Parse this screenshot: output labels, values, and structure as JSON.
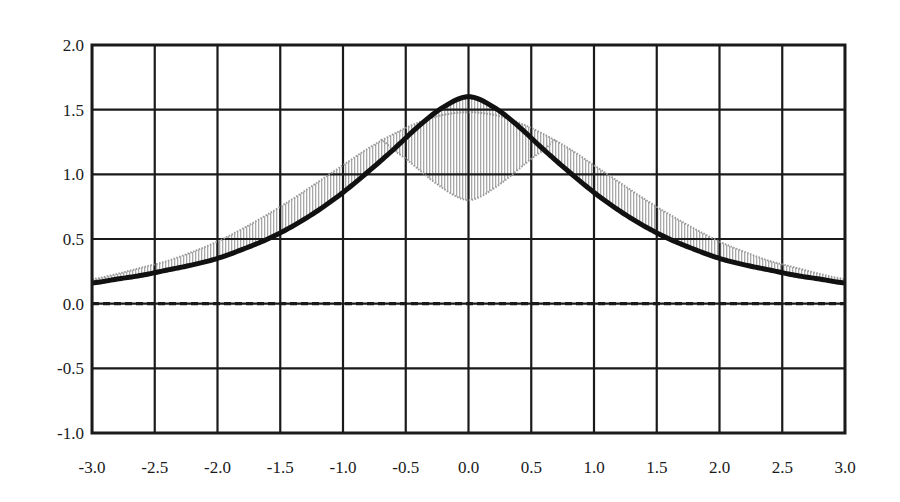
{
  "chart_data": {
    "type": "line",
    "title": "",
    "subtitle": "",
    "xlabel": "",
    "ylabel": "",
    "xlim": [
      -3.0,
      3.0
    ],
    "ylim": [
      -1.0,
      2.0
    ],
    "xticks": [
      -3.0,
      -2.5,
      -2.0,
      -1.5,
      -1.0,
      -0.5,
      0.0,
      0.5,
      1.0,
      1.5,
      2.0,
      2.5,
      3.0
    ],
    "yticks": [
      -1.0,
      -0.5,
      0.0,
      0.5,
      1.0,
      1.5,
      2.0
    ],
    "xtick_labels": [
      "-3.0",
      "-2.5",
      "-2.0",
      "-1.5",
      "-1.0",
      "-0.5",
      "0.0",
      "0.5",
      "1.0",
      "1.5",
      "2.0",
      "2.5",
      "3.0"
    ],
    "ytick_labels": [
      "-1.0",
      "-0.5",
      "0.0",
      "0.5",
      "1.0",
      "1.5",
      "2.0"
    ],
    "grid": true,
    "grid_color": "#1a1a1a",
    "legend": "none",
    "zero_line": {
      "y": 0.0,
      "style": "dashed",
      "color": "#1a1a1a"
    },
    "series": [
      {
        "name": "solid-curve",
        "style": "solid",
        "color": "#111111",
        "line_width": 5,
        "x": [
          -3.0,
          -2.8,
          -2.6,
          -2.4,
          -2.2,
          -2.0,
          -1.8,
          -1.6,
          -1.4,
          -1.2,
          -1.0,
          -0.8,
          -0.6,
          -0.4,
          -0.2,
          0.0,
          0.2,
          0.4,
          0.6,
          0.8,
          1.0,
          1.2,
          1.4,
          1.6,
          1.8,
          2.0,
          2.2,
          2.4,
          2.6,
          2.8,
          3.0
        ],
        "y": [
          0.16,
          0.19,
          0.22,
          0.26,
          0.3,
          0.35,
          0.42,
          0.5,
          0.6,
          0.72,
          0.86,
          1.02,
          1.19,
          1.37,
          1.52,
          1.6,
          1.52,
          1.37,
          1.19,
          1.02,
          0.86,
          0.72,
          0.6,
          0.5,
          0.42,
          0.35,
          0.3,
          0.26,
          0.22,
          0.19,
          0.16
        ]
      },
      {
        "name": "stippled-curve",
        "style": "stippled",
        "color": "#9a9a9a",
        "line_width": 2,
        "x": [
          -3.0,
          -2.8,
          -2.6,
          -2.4,
          -2.2,
          -2.0,
          -1.8,
          -1.6,
          -1.4,
          -1.2,
          -1.0,
          -0.8,
          -0.6,
          -0.4,
          -0.2,
          0.0,
          0.2,
          0.4,
          0.6,
          0.8,
          1.0,
          1.2,
          1.4,
          1.6,
          1.8,
          2.0,
          2.2,
          2.4,
          2.6,
          2.8,
          3.0
        ],
        "y": [
          0.19,
          0.23,
          0.28,
          0.33,
          0.4,
          0.48,
          0.58,
          0.69,
          0.81,
          0.94,
          1.07,
          1.2,
          1.31,
          1.4,
          1.46,
          1.48,
          1.46,
          1.4,
          1.31,
          1.2,
          1.07,
          0.94,
          0.81,
          0.69,
          0.58,
          0.48,
          0.4,
          0.33,
          0.28,
          0.23,
          0.19
        ]
      },
      {
        "name": "stippled-lower-curve",
        "style": "stippled",
        "color": "#9a9a9a",
        "line_width": 2,
        "x": [
          -0.7,
          -0.6,
          -0.5,
          -0.4,
          -0.3,
          -0.2,
          -0.1,
          0.0,
          0.1,
          0.2,
          0.3,
          0.4,
          0.5,
          0.6,
          0.7
        ],
        "y": [
          1.27,
          1.19,
          1.12,
          1.04,
          0.96,
          0.89,
          0.83,
          0.8,
          0.83,
          0.89,
          0.96,
          1.04,
          1.12,
          1.19,
          1.27
        ]
      }
    ],
    "shaded_region": {
      "name": "between-curves",
      "fill": "#b8b8b8",
      "pattern": "vertical-hatch",
      "description": "Region bounded by the solid black curve and the stippled curve; stippled curve lies above the solid curve for |x| > 0.5 and dips below it near x = 0."
    }
  },
  "axes": {
    "plot_left_px": 92,
    "plot_right_px": 845,
    "plot_top_px": 45,
    "plot_bottom_px": 433
  }
}
